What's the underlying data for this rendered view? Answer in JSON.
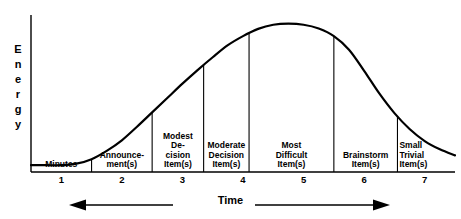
{
  "chart_data": {
    "type": "line",
    "title": "",
    "xlabel": "Time",
    "ylabel": "Energy",
    "grid": false,
    "legend": "none",
    "xlim": [
      0.5,
      7.5
    ],
    "ylim": [
      0,
      1
    ],
    "xticks": [
      "1",
      "2",
      "3",
      "4",
      "5",
      "6",
      "7"
    ],
    "yticks": [],
    "annotations": {
      "left_arrow": "left-arrow",
      "right_arrow": "right-arrow"
    },
    "segments": [
      {
        "label": "Minutes",
        "x_start": 0.5,
        "x_end": 1.5,
        "align": "center"
      },
      {
        "label": "Announce-\nment(s)",
        "x_start": 1.5,
        "x_end": 2.5,
        "align": "center"
      },
      {
        "label": "Modest\nDe-\ncision\nItem(s)",
        "x_start": 2.5,
        "x_end": 3.35,
        "align": "center"
      },
      {
        "label": "Moderate\nDecision\nItem(s)",
        "x_start": 3.35,
        "x_end": 4.1,
        "align": "center"
      },
      {
        "label": "Most\nDifficult\nItem(s)",
        "x_start": 4.1,
        "x_end": 5.5,
        "align": "center"
      },
      {
        "label": "Brainstorm\nItem(s)",
        "x_start": 5.5,
        "x_end": 6.55,
        "align": "center"
      },
      {
        "label": "Small\nTrivial Item(s)",
        "x_start": 6.55,
        "x_end": 7.5,
        "align": "left"
      }
    ],
    "series": [
      {
        "name": "Energy",
        "x": [
          0.5,
          0.75,
          1.0,
          1.25,
          1.5,
          1.75,
          2.0,
          2.25,
          2.5,
          2.75,
          3.0,
          3.25,
          3.5,
          3.75,
          4.0,
          4.25,
          4.5,
          4.75,
          5.0,
          5.25,
          5.5,
          5.75,
          6.0,
          6.25,
          6.5,
          6.75,
          7.0,
          7.25,
          7.5
        ],
        "y": [
          0.045,
          0.045,
          0.045,
          0.055,
          0.085,
          0.14,
          0.21,
          0.3,
          0.395,
          0.49,
          0.585,
          0.675,
          0.76,
          0.84,
          0.9,
          0.948,
          0.975,
          0.982,
          0.975,
          0.95,
          0.9,
          0.81,
          0.67,
          0.52,
          0.39,
          0.285,
          0.205,
          0.15,
          0.11
        ]
      }
    ],
    "colors": {
      "curve": "#000000",
      "axis": "#000000",
      "divider": "#000000",
      "background": "#ffffff",
      "text": "#000000"
    }
  },
  "axis": {
    "y_title_letters": [
      "E",
      "n",
      "e",
      "r",
      "g",
      "y"
    ]
  }
}
